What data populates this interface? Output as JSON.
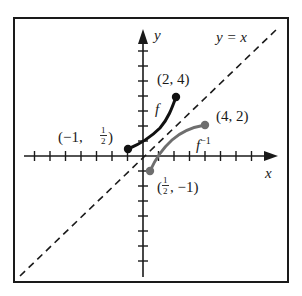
{
  "diagram": {
    "axes": {
      "x_label": "x",
      "y_label": "y"
    },
    "line_label": "y = x",
    "curve_f": {
      "label": "f",
      "start": "(−1, ½)",
      "end": "(2, 4)",
      "color": "#111111"
    },
    "curve_finv": {
      "label": "f",
      "label_sup": "−1",
      "start": "(½, −1)",
      "end": "(4, 2)",
      "color": "#6e6e6e"
    },
    "points": {
      "p_neg1_half": {
        "pre": "(−1, ",
        "frac_num": "1",
        "frac_den": "2",
        "post": ")"
      },
      "p_2_4": "(2, 4)",
      "p_4_2": "(4, 2)",
      "p_half_neg1": {
        "pre": "(",
        "frac_num": "1",
        "frac_den": "2",
        "post": ", −1)"
      }
    }
  }
}
